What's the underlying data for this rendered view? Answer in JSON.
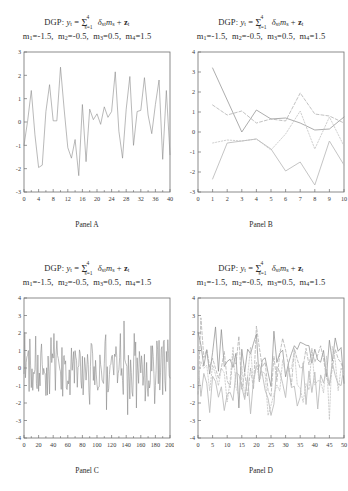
{
  "figure": {
    "title_line1_prefix": "DGP:",
    "title_line1_y": "y",
    "title_line1_t": "t",
    "title_line1_eq": "=",
    "title_sigma": "Σ",
    "title_sigma_sup": "4",
    "title_sigma_sub": "s=1",
    "title_delta": "δ",
    "title_delta_sub": "st",
    "title_m": "m",
    "title_m_sub": "s",
    "title_plus": "+",
    "title_z": "z",
    "title_z_sub": "t",
    "title_line2": "m1=-1.5,  m2=-0.5,  m3=0.5,  m4=1.5",
    "params": [
      {
        "name": "m",
        "sub": "1",
        "value": "-1.5"
      },
      {
        "name": "m",
        "sub": "2",
        "value": "-0.5"
      },
      {
        "name": "m",
        "sub": "3",
        "value": "0.5"
      },
      {
        "name": "m",
        "sub": "4",
        "value": "1.5"
      }
    ],
    "colors": {
      "axis": "#6f6f6f",
      "series_solid_dark": "#8a8a8a",
      "series_solid_light": "#bdbdbd",
      "series_dashed": "#a8a8a8",
      "series_dotted": "#c4c4c4",
      "text": "#2b2b2b",
      "background": "#ffffff"
    }
  },
  "panels": [
    {
      "id": "A",
      "label": "Panel A",
      "xlabel": "",
      "ylabel": "",
      "xticks": [
        0,
        4,
        8,
        12,
        16,
        20,
        24,
        28,
        32,
        36,
        40
      ],
      "yticks": [
        -3,
        -2,
        -1,
        0,
        1,
        2,
        3
      ],
      "xlim": [
        0,
        40
      ],
      "ylim": [
        -3,
        3
      ]
    },
    {
      "id": "B",
      "label": "Panel B",
      "xlabel": "",
      "ylabel": "",
      "xticks": [
        0,
        1,
        2,
        3,
        4,
        5,
        6,
        7,
        8,
        9,
        10
      ],
      "yticks": [
        -3,
        -2,
        -1,
        0,
        1,
        2,
        3,
        4
      ],
      "xlim": [
        0,
        10
      ],
      "ylim": [
        -3,
        4
      ]
    },
    {
      "id": "C",
      "label": "Panel C",
      "xlabel": "",
      "ylabel": "",
      "xticks": [
        0,
        20,
        40,
        60,
        80,
        100,
        120,
        140,
        160,
        180,
        200
      ],
      "yticks": [
        -4,
        -3,
        -2,
        -1,
        0,
        1,
        2,
        3,
        4
      ],
      "xlim": [
        0,
        200
      ],
      "ylim": [
        -4,
        4
      ]
    },
    {
      "id": "D",
      "label": "Panel D",
      "xlabel": "",
      "ylabel": "",
      "xticks": [
        0,
        5,
        10,
        15,
        20,
        25,
        30,
        35,
        40,
        45,
        50
      ],
      "yticks": [
        -4,
        -3,
        -2,
        -1,
        0,
        1,
        2,
        3,
        4
      ],
      "xlim": [
        0,
        50
      ],
      "ylim": [
        -4,
        4
      ]
    }
  ],
  "chart_data": [
    {
      "type": "line",
      "panel": "A",
      "title": "DGP: y_t = Σ^4_{s=1} δ_st m_s + z_t ; m1=-1.5, m2=-0.5, m3=0.5, m4=1.5",
      "xlabel": "Panel A",
      "ylabel": "",
      "xlim": [
        0,
        40
      ],
      "ylim": [
        -3,
        3
      ],
      "grid": false,
      "legend": "none",
      "x": [
        0,
        1,
        2,
        3,
        4,
        5,
        6,
        7,
        8,
        9,
        10,
        11,
        12,
        13,
        14,
        15,
        16,
        17,
        18,
        19,
        20,
        21,
        22,
        23,
        24,
        25,
        26,
        27,
        28,
        29,
        30,
        31,
        32,
        33,
        34,
        35,
        36,
        37,
        38,
        39,
        40
      ],
      "series": [
        {
          "name": "y_t",
          "style": "solid",
          "values": [
            -1.0,
            0.05,
            1.35,
            -0.55,
            -1.95,
            -1.85,
            0.45,
            1.6,
            0.05,
            0.05,
            2.35,
            0.55,
            -1.1,
            -1.55,
            -0.75,
            -2.3,
            0.75,
            -1.7,
            0.55,
            0.1,
            0.35,
            -0.1,
            0.65,
            0.2,
            0.45,
            2.15,
            -0.4,
            -1.55,
            0.55,
            1.95,
            -1.0,
            0.45,
            0.5,
            1.9,
            0.3,
            -0.5,
            0.75,
            1.8,
            -1.6,
            1.35,
            -1.4,
            0.95,
            -0.6
          ]
        }
      ]
    },
    {
      "type": "line",
      "panel": "B",
      "title": "DGP: y_t = Σ^4_{s=1} δ_st m_s + z_t ; m1=-1.5, m2=-0.5, m3=0.5, m4=1.5",
      "xlabel": "Panel B",
      "ylabel": "",
      "xlim": [
        0,
        10
      ],
      "ylim": [
        -3,
        4
      ],
      "grid": false,
      "legend": "none",
      "x": [
        1,
        2,
        3,
        4,
        5,
        6,
        7,
        8,
        9,
        10
      ],
      "series": [
        {
          "name": "series-1",
          "style": "solid-dark",
          "values": [
            3.2,
            1.6,
            0.0,
            1.1,
            0.65,
            0.7,
            0.45,
            0.1,
            0.15,
            0.75
          ]
        },
        {
          "name": "series-2",
          "style": "dashed",
          "values": [
            1.35,
            0.85,
            1.05,
            0.45,
            0.65,
            0.55,
            1.95,
            0.9,
            0.8,
            0.45
          ]
        },
        {
          "name": "series-3",
          "style": "dotted",
          "values": [
            -0.55,
            -0.4,
            -0.45,
            -0.35,
            -0.9,
            -0.1,
            1.05,
            -0.85,
            0.75,
            -0.7
          ]
        },
        {
          "name": "series-4",
          "style": "solid-light",
          "values": [
            -2.35,
            -0.55,
            -0.45,
            -0.35,
            -0.85,
            -1.95,
            -1.5,
            -2.65,
            -0.45,
            -1.65
          ]
        }
      ]
    },
    {
      "type": "line",
      "panel": "C",
      "title": "DGP: y_t = Σ^4_{s=1} δ_st m_s + z_t ; m1=-1.5, m2=-0.5, m3=0.5, m4=1.5",
      "xlabel": "Panel C",
      "ylabel": "",
      "xlim": [
        0,
        200
      ],
      "ylim": [
        -4,
        4
      ],
      "grid": false,
      "legend": "none",
      "n_points": 200,
      "series": [
        {
          "name": "y_t",
          "style": "solid",
          "description": "dense noisy series oscillating about 0 with range roughly -3.3 to 3.3"
        }
      ]
    },
    {
      "type": "line",
      "panel": "D",
      "title": "DGP: y_t = Σ^4_{s=1} δ_st m_s + z_t ; m1=-1.5, m2=-0.5, m3=0.5, m4=1.5",
      "xlabel": "Panel D",
      "ylabel": "",
      "xlim": [
        0,
        50
      ],
      "ylim": [
        -4,
        4
      ],
      "grid": false,
      "legend": "none",
      "n_points": 50,
      "series": [
        {
          "name": "series-1",
          "style": "solid-dark",
          "description": "noisy series centered near +0.8"
        },
        {
          "name": "series-2",
          "style": "dashed",
          "description": "noisy series centered near +0.2"
        },
        {
          "name": "series-3",
          "style": "dotted",
          "description": "noisy series centered near -0.4"
        },
        {
          "name": "series-4",
          "style": "solid-light",
          "description": "noisy series centered near -1.2"
        }
      ]
    }
  ]
}
